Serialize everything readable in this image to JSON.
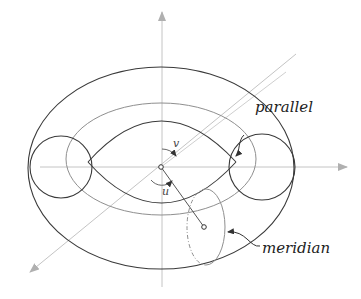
{
  "diagram": {
    "labels": {
      "parallel": "parallel",
      "meridian": "meridian",
      "angle_v": "v",
      "angle_u": "u"
    },
    "colors": {
      "background": "#ffffff",
      "outline": "#3a3a3a",
      "parallel_curve": "#8a8a8a",
      "axes": "#bdbdbd",
      "label": "#222222"
    },
    "geometry": {
      "center": [
        161,
        167
      ],
      "outer_ellipse": {
        "cx": 161,
        "cy": 168,
        "rx": 133,
        "ry": 101
      },
      "parallel_ellipse": {
        "cx": 161,
        "cy": 159,
        "rx": 95,
        "ry": 56
      },
      "left_tube_circle": {
        "cx": 61,
        "cy": 167,
        "r": 31
      },
      "right_tube_circle": {
        "cx": 262,
        "cy": 167,
        "r": 33
      },
      "meridian_ellipse": {
        "cx": 206,
        "cy": 227,
        "rx": 19,
        "ry": 38
      },
      "point_on_surface": [
        204,
        227
      ]
    }
  }
}
